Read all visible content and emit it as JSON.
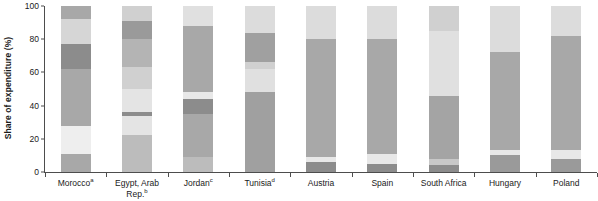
{
  "chart_data": {
    "type": "bar",
    "subtype": "stacked-bar-100",
    "title": "",
    "xlabel": "",
    "ylabel": "Share of expenditure (%)",
    "ylim": [
      0,
      100
    ],
    "yticks": [
      0,
      20,
      40,
      60,
      80,
      100
    ],
    "grid": false,
    "legend": "none",
    "categories": [
      "Morocco",
      "Egypt, Arab Rep.",
      "Jordan",
      "Tunisia",
      "Austria",
      "Spain",
      "South Africa",
      "Hungary",
      "Poland"
    ],
    "category_footnotes": [
      "a",
      "b",
      "c",
      "d",
      "",
      "",
      "",
      "",
      ""
    ],
    "category_labels_display": [
      "Morocco<sup>a</sup>",
      "Egypt, Arab<br>Rep.<sup>b</sup>",
      "Jordan<sup>c</sup>",
      "Tunisia<sup>d</sup>",
      "Austria",
      "Spain",
      "South Africa",
      "Hungary",
      "Poland"
    ],
    "series": [
      {
        "name": "segment-1",
        "color": "#a8a8a8",
        "values": [
          11,
          22,
          9,
          48,
          6,
          5,
          8,
          10,
          8
        ]
      },
      {
        "name": "segment-2",
        "color": "#e8e8e8",
        "values": [
          17,
          12,
          35,
          13,
          2,
          6,
          38,
          3,
          5
        ]
      },
      {
        "name": "segment-3",
        "color": "#a8a8a8",
        "values": [
          34,
          2,
          2,
          18,
          71,
          69,
          39,
          59,
          69
        ]
      },
      {
        "name": "segment-4",
        "color": "#8c8c8c",
        "values": [
          15,
          14,
          43,
          21,
          0,
          0,
          0,
          0,
          0
        ]
      },
      {
        "name": "segment-5",
        "color": "#d8d8d8",
        "values": [
          15,
          41,
          11,
          0,
          21,
          20,
          15,
          28,
          18
        ]
      },
      {
        "name": "segment-6",
        "color": "#8c8c8c",
        "values": [
          8,
          9,
          0,
          0,
          0,
          0,
          0,
          0,
          0
        ]
      }
    ],
    "stacks": [
      {
        "category": "Morocco",
        "segments": [
          {
            "from": 0,
            "to": 11,
            "value": 11,
            "color": "#a8a8a8"
          },
          {
            "from": 11,
            "to": 28,
            "value": 17,
            "color": "#eeeeee"
          },
          {
            "from": 28,
            "to": 62,
            "value": 34,
            "color": "#a8a8a8"
          },
          {
            "from": 62,
            "to": 77,
            "value": 15,
            "color": "#8c8c8c"
          },
          {
            "from": 77,
            "to": 92,
            "value": 15,
            "color": "#d6d6d6"
          },
          {
            "from": 92,
            "to": 100,
            "value": 8,
            "color": "#a8a8a8"
          }
        ]
      },
      {
        "category": "Egypt, Arab Rep.",
        "segments": [
          {
            "from": 0,
            "to": 22,
            "value": 22,
            "color": "#bcbcbc"
          },
          {
            "from": 22,
            "to": 34,
            "value": 12,
            "color": "#e4e4e4"
          },
          {
            "from": 34,
            "to": 36,
            "value": 2,
            "color": "#8c8c8c"
          },
          {
            "from": 36,
            "to": 50,
            "value": 14,
            "color": "#e4e4e4"
          },
          {
            "from": 50,
            "to": 63,
            "value": 13,
            "color": "#d0d0d0"
          },
          {
            "from": 63,
            "to": 80,
            "value": 17,
            "color": "#b4b4b4"
          },
          {
            "from": 80,
            "to": 91,
            "value": 11,
            "color": "#9a9a9a"
          },
          {
            "from": 91,
            "to": 100,
            "value": 9,
            "color": "#d0d0d0"
          }
        ]
      },
      {
        "category": "Jordan",
        "segments": [
          {
            "from": 0,
            "to": 9,
            "value": 9,
            "color": "#bcbcbc"
          },
          {
            "from": 9,
            "to": 35,
            "value": 26,
            "color": "#a8a8a8"
          },
          {
            "from": 35,
            "to": 44,
            "value": 9,
            "color": "#8c8c8c"
          },
          {
            "from": 44,
            "to": 48,
            "value": 4,
            "color": "#e8e8e8"
          },
          {
            "from": 48,
            "to": 88,
            "value": 40,
            "color": "#a8a8a8"
          },
          {
            "from": 88,
            "to": 100,
            "value": 12,
            "color": "#e0e0e0"
          }
        ]
      },
      {
        "category": "Tunisia",
        "segments": [
          {
            "from": 0,
            "to": 48,
            "value": 48,
            "color": "#a0a0a0"
          },
          {
            "from": 48,
            "to": 62,
            "value": 14,
            "color": "#e0e0e0"
          },
          {
            "from": 62,
            "to": 66,
            "value": 4,
            "color": "#d0d0d0"
          },
          {
            "from": 66,
            "to": 84,
            "value": 18,
            "color": "#a0a0a0"
          },
          {
            "from": 84,
            "to": 100,
            "value": 16,
            "color": "#dcdcdc"
          }
        ]
      },
      {
        "category": "Austria",
        "segments": [
          {
            "from": 0,
            "to": 6,
            "value": 6,
            "color": "#8c8c8c"
          },
          {
            "from": 6,
            "to": 9,
            "value": 3,
            "color": "#e8e8e8"
          },
          {
            "from": 9,
            "to": 80,
            "value": 71,
            "color": "#a8a8a8"
          },
          {
            "from": 80,
            "to": 100,
            "value": 20,
            "color": "#dcdcdc"
          }
        ]
      },
      {
        "category": "Spain",
        "segments": [
          {
            "from": 0,
            "to": 5,
            "value": 5,
            "color": "#8c8c8c"
          },
          {
            "from": 5,
            "to": 11,
            "value": 6,
            "color": "#e8e8e8"
          },
          {
            "from": 11,
            "to": 80,
            "value": 69,
            "color": "#a8a8a8"
          },
          {
            "from": 80,
            "to": 100,
            "value": 20,
            "color": "#dcdcdc"
          }
        ]
      },
      {
        "category": "South Africa",
        "segments": [
          {
            "from": 0,
            "to": 4,
            "value": 4,
            "color": "#8c8c8c"
          },
          {
            "from": 4,
            "to": 8,
            "value": 4,
            "color": "#c8c8c8"
          },
          {
            "from": 8,
            "to": 46,
            "value": 38,
            "color": "#a4a4a4"
          },
          {
            "from": 46,
            "to": 85,
            "value": 39,
            "color": "#e0e0e0"
          },
          {
            "from": 85,
            "to": 100,
            "value": 15,
            "color": "#d0d0d0"
          }
        ]
      },
      {
        "category": "Hungary",
        "segments": [
          {
            "from": 0,
            "to": 10,
            "value": 10,
            "color": "#9a9a9a"
          },
          {
            "from": 10,
            "to": 13,
            "value": 3,
            "color": "#e8e8e8"
          },
          {
            "from": 13,
            "to": 72,
            "value": 59,
            "color": "#a8a8a8"
          },
          {
            "from": 72,
            "to": 100,
            "value": 28,
            "color": "#dcdcdc"
          }
        ]
      },
      {
        "category": "Poland",
        "segments": [
          {
            "from": 0,
            "to": 8,
            "value": 8,
            "color": "#9a9a9a"
          },
          {
            "from": 8,
            "to": 13,
            "value": 5,
            "color": "#e8e8e8"
          },
          {
            "from": 13,
            "to": 82,
            "value": 69,
            "color": "#a8a8a8"
          },
          {
            "from": 82,
            "to": 100,
            "value": 18,
            "color": "#dcdcdc"
          }
        ]
      }
    ],
    "axis_color": "#4d4d4d",
    "background": "#ffffff"
  }
}
